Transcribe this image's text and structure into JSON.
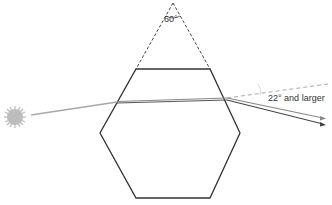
{
  "diagram": {
    "angle_label": "60°",
    "halo_label": "22° and larger",
    "elements": {
      "sun": "sun-icon",
      "crystal": "hexagonal-ice-crystal",
      "prism_extension": "dashed-60-degree-wedge",
      "incoming_ray": "light-ray-in",
      "deviated_rays": [
        "refracted-ray-1",
        "refracted-ray-2"
      ],
      "reference_line": "undeviated-dashed-line"
    },
    "colors": {
      "outline": "#333333",
      "ray": "#9a9a9a",
      "ray_dark": "#555555",
      "sun": "#b8b8b8"
    }
  }
}
